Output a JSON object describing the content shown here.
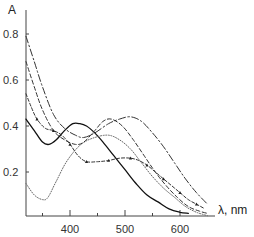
{
  "chart_data": {
    "type": "line",
    "title": "",
    "xlabel": "λ, nm",
    "ylabel": "A",
    "xlim": [
      320,
      665
    ],
    "ylim": [
      0,
      0.86
    ],
    "grid": false,
    "legend": "none",
    "x_ticks": [
      350,
      400,
      450,
      500,
      550,
      600
    ],
    "x_tick_labels": [
      {
        "value": 400,
        "label": "400"
      },
      {
        "value": 500,
        "label": "500"
      },
      {
        "value": 600,
        "label": "600"
      }
    ],
    "y_ticks": [
      0.2,
      0.4,
      0.6,
      0.8
    ],
    "y_tick_labels": [
      {
        "value": 0.2,
        "label": "0.2"
      },
      {
        "value": 0.4,
        "label": "0.4"
      },
      {
        "value": 0.6,
        "label": "0.6"
      },
      {
        "value": 0.8,
        "label": "0.8"
      }
    ],
    "series": [
      {
        "name": "solid",
        "style": "solid",
        "x": [
          320,
          335,
          350,
          362,
          375,
          390,
          405,
          418,
          430,
          445,
          460,
          480,
          500,
          520,
          540,
          560,
          580,
          600,
          615
        ],
        "y": [
          0.43,
          0.38,
          0.33,
          0.32,
          0.34,
          0.38,
          0.41,
          0.41,
          0.4,
          0.37,
          0.33,
          0.27,
          0.21,
          0.15,
          0.1,
          0.07,
          0.04,
          0.025,
          0.02
        ]
      },
      {
        "name": "dotted",
        "style": "dotted",
        "x": [
          320,
          335,
          350,
          360,
          375,
          395,
          420,
          445,
          470,
          490,
          510,
          530,
          550,
          570,
          590,
          610,
          630,
          650
        ],
        "y": [
          0.15,
          0.1,
          0.08,
          0.09,
          0.16,
          0.25,
          0.32,
          0.35,
          0.36,
          0.34,
          0.3,
          0.24,
          0.18,
          0.13,
          0.09,
          0.05,
          0.025,
          0.01
        ]
      },
      {
        "name": "dash-dot",
        "style": "dashdot",
        "x": [
          320,
          335,
          350,
          370,
          390,
          410,
          425,
          445,
          470,
          490,
          510,
          530,
          550,
          570,
          590,
          610,
          630,
          650
        ],
        "y": [
          0.79,
          0.68,
          0.57,
          0.45,
          0.39,
          0.36,
          0.35,
          0.37,
          0.41,
          0.43,
          0.44,
          0.42,
          0.37,
          0.31,
          0.24,
          0.17,
          0.11,
          0.06
        ]
      },
      {
        "name": "dashed",
        "style": "dashed",
        "x": [
          320,
          335,
          350,
          370,
          390,
          410,
          425,
          445,
          460,
          475,
          495,
          515,
          535,
          555,
          575,
          595,
          615,
          635,
          650
        ],
        "y": [
          0.68,
          0.57,
          0.47,
          0.38,
          0.34,
          0.32,
          0.33,
          0.38,
          0.42,
          0.43,
          0.4,
          0.34,
          0.27,
          0.2,
          0.14,
          0.09,
          0.05,
          0.03,
          0.02
        ]
      },
      {
        "name": "dashed-triangles",
        "style": "dashed-markers",
        "x": [
          320,
          330,
          340,
          355,
          370,
          385,
          400,
          415,
          430,
          450,
          470,
          490,
          510,
          525,
          540,
          555,
          570,
          585,
          600,
          615,
          630,
          645
        ],
        "y": [
          0.54,
          0.48,
          0.43,
          0.39,
          0.38,
          0.36,
          0.32,
          0.27,
          0.245,
          0.245,
          0.25,
          0.26,
          0.26,
          0.25,
          0.23,
          0.2,
          0.17,
          0.14,
          0.11,
          0.08,
          0.06,
          0.04
        ]
      }
    ]
  },
  "axes": {
    "y_title": "A",
    "x_title": "λ, nm"
  }
}
